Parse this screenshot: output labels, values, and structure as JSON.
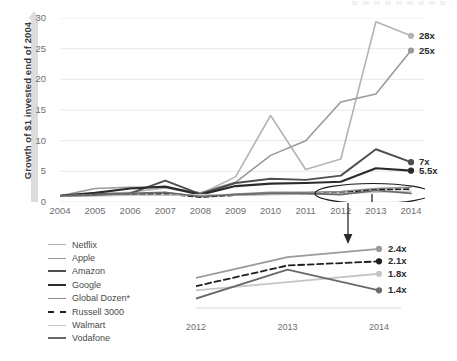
{
  "axes": {
    "y_title": "Growth of $1 invested end of 2004",
    "y_ticks": [
      "30",
      "25",
      "20",
      "15",
      "10",
      "5",
      "0"
    ],
    "x_ticks": [
      "2004",
      "2005",
      "2006",
      "2007",
      "2008",
      "2009",
      "2010",
      "2011",
      "2012",
      "2013",
      "2014"
    ]
  },
  "main_end_labels": [
    {
      "text": "28x",
      "color": "#a8a8a8"
    },
    {
      "text": "25x",
      "color": "#6d6d6d"
    },
    {
      "text": "7x",
      "color": "#3c3c3c"
    },
    {
      "text": "5.5x",
      "color": "#2a2a2a"
    }
  ],
  "legend": {
    "items": [
      {
        "label": "Netflix",
        "color": "#b4b4b4",
        "dash": "none",
        "width": 1.6
      },
      {
        "label": "Apple",
        "color": "#9a9a9a",
        "dash": "none",
        "width": 1.8
      },
      {
        "label": "Amazon",
        "color": "#4f4f4f",
        "dash": "none",
        "width": 2.0
      },
      {
        "label": "Google",
        "color": "#2b2b2b",
        "dash": "none",
        "width": 2.4
      },
      {
        "label": "Global Dozen*",
        "color": "#8e8e8e",
        "dash": "none",
        "width": 1.8
      },
      {
        "label": "Russell 3000",
        "color": "#1f1f1f",
        "dash": "dashed",
        "width": 2.2
      },
      {
        "label": "Walmart",
        "color": "#c6c6c6",
        "dash": "none",
        "width": 1.8
      },
      {
        "label": "Vodafone",
        "color": "#6a6a6a",
        "dash": "none",
        "width": 2.0
      }
    ]
  },
  "inset": {
    "x_ticks": [
      "2012",
      "2013",
      "2014"
    ],
    "end_labels": [
      {
        "text": "2.4x",
        "color": "#9a9a9a"
      },
      {
        "text": "2.1x",
        "color": "#1f1f1f"
      },
      {
        "text": "1.8x",
        "color": "#c6c6c6"
      },
      {
        "text": "1.4x",
        "color": "#6a6a6a"
      }
    ]
  },
  "chart_data": {
    "type": "line",
    "title": "",
    "xlabel": "",
    "ylabel": "Growth of $1 invested end of 2004",
    "x": [
      2004,
      2005,
      2006,
      2007,
      2008,
      2009,
      2010,
      2011,
      2012,
      2013,
      2014
    ],
    "ylim": [
      0,
      30
    ],
    "yticks": [
      0,
      5,
      10,
      15,
      20,
      25,
      30
    ],
    "grid": true,
    "legend_position": "bottom-left",
    "annotations": [
      {
        "text": "28x",
        "at_x": 2014,
        "at_y": 27.1
      },
      {
        "text": "25x",
        "at_x": 2014,
        "at_y": 24.7
      },
      {
        "text": "7x",
        "at_x": 2014,
        "at_y": 6.5
      },
      {
        "text": "5.5x",
        "at_x": 2014,
        "at_y": 5.1
      },
      {
        "text": "ellipse-highlight-low-lines",
        "at_x": 2013,
        "at_y": 1.6
      },
      {
        "text": "divider-line-2012-2013",
        "at_x": 2012.5,
        "at_y": 0
      },
      {
        "text": "arrow-down-to-inset",
        "at_x": 2012.6,
        "at_y": 0
      }
    ],
    "series": [
      {
        "name": "Netflix",
        "color": "#b4b4b4",
        "values": [
          1.0,
          1.3,
          1.6,
          2.3,
          1.3,
          4.1,
          14.1,
          5.3,
          7.0,
          29.4,
          27.1
        ],
        "end_label": "28x"
      },
      {
        "name": "Apple",
        "color": "#9a9a9a",
        "values": [
          1.0,
          2.2,
          2.4,
          2.4,
          1.5,
          3.2,
          7.6,
          10.0,
          16.3,
          17.6,
          24.7
        ],
        "end_label": "25x"
      },
      {
        "name": "Amazon",
        "color": "#4f4f4f",
        "values": [
          1.0,
          1.3,
          1.4,
          3.5,
          1.3,
          3.1,
          3.8,
          3.6,
          4.3,
          8.6,
          6.5
        ],
        "end_label": "7x"
      },
      {
        "name": "Google",
        "color": "#2b2b2b",
        "values": [
          1.0,
          1.5,
          2.2,
          2.5,
          1.2,
          2.6,
          3.0,
          3.1,
          3.3,
          5.5,
          5.1
        ],
        "end_label": "5.5x"
      },
      {
        "name": "Global Dozen*",
        "color": "#8e8e8e",
        "values": [
          1.0,
          1.2,
          1.3,
          1.5,
          0.9,
          1.3,
          1.6,
          1.6,
          1.7,
          2.2,
          2.4
        ],
        "end_label": "2.4x"
      },
      {
        "name": "Russell 3000",
        "color": "#1f1f1f",
        "dash": "dashed",
        "values": [
          1.0,
          1.1,
          1.2,
          1.3,
          0.8,
          1.1,
          1.3,
          1.3,
          1.5,
          2.0,
          2.1
        ],
        "end_label": "2.1x"
      },
      {
        "name": "Walmart",
        "color": "#c6c6c6",
        "values": [
          1.0,
          1.0,
          1.1,
          1.1,
          1.2,
          1.1,
          1.2,
          1.3,
          1.4,
          1.6,
          1.8
        ],
        "end_label": "1.8x"
      },
      {
        "name": "Vodafone",
        "color": "#6a6a6a",
        "values": [
          1.0,
          1.1,
          1.4,
          1.6,
          0.9,
          1.2,
          1.4,
          1.4,
          1.2,
          1.9,
          1.4
        ],
        "end_label": "1.4x"
      }
    ],
    "inset": {
      "type": "line",
      "note": "zoomed detail of the four lowest series, 2012-2014",
      "x": [
        2012,
        2013,
        2014
      ],
      "series": [
        {
          "name": "Global Dozen*",
          "color": "#9a9a9a",
          "values": [
            1.7,
            2.2,
            2.4
          ],
          "end_label": "2.4x"
        },
        {
          "name": "Russell 3000",
          "color": "#1f1f1f",
          "dash": "dashed",
          "values": [
            1.5,
            2.0,
            2.1
          ],
          "end_label": "2.1x"
        },
        {
          "name": "Walmart",
          "color": "#c6c6c6",
          "values": [
            1.4,
            1.6,
            1.8
          ],
          "end_label": "1.8x"
        },
        {
          "name": "Vodafone",
          "color": "#6a6a6a",
          "values": [
            1.2,
            1.9,
            1.4
          ],
          "end_label": "1.4x"
        }
      ]
    }
  }
}
